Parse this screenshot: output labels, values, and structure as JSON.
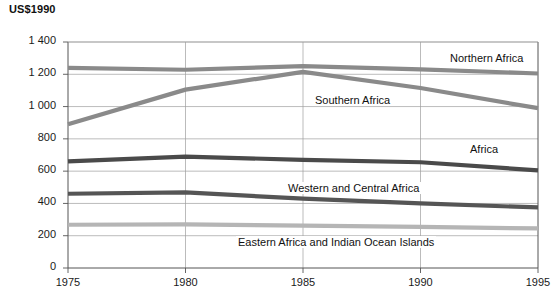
{
  "chart_data": {
    "type": "line",
    "title": "US$1990",
    "xlabel": "",
    "ylabel": "US$1990",
    "x": [
      1975,
      1980,
      1985,
      1990,
      1995
    ],
    "xlim": [
      1975,
      1995
    ],
    "ylim": [
      0,
      1400
    ],
    "yticks": [
      "0",
      "200",
      "400",
      "600",
      "800",
      "1 000",
      "1 200",
      "1 400"
    ],
    "xticks": [
      "1975",
      "1980",
      "1985",
      "1990",
      "1995"
    ],
    "grid": true,
    "legend": "inline-labels",
    "series": [
      {
        "name": "Northern Africa",
        "color": "#8a8a8a",
        "values": [
          1240,
          1228,
          1250,
          1230,
          1205
        ]
      },
      {
        "name": "Southern Africa",
        "color": "#8a8a8a",
        "values": [
          890,
          1105,
          1215,
          1115,
          990
        ]
      },
      {
        "name": "Africa",
        "color": "#4a4a4a",
        "values": [
          660,
          690,
          670,
          655,
          605
        ]
      },
      {
        "name": "Western and Central Africa",
        "color": "#555555",
        "values": [
          460,
          468,
          430,
          400,
          375
        ]
      },
      {
        "name": "Eastern Africa and Indian Ocean Islands",
        "color": "#b5b5b5",
        "values": [
          268,
          270,
          262,
          255,
          245
        ]
      }
    ],
    "annotations": [
      {
        "text": "Northern Africa",
        "x": 448,
        "y": 52
      },
      {
        "text": "Southern Africa",
        "x": 313,
        "y": 94
      },
      {
        "text": "Africa",
        "x": 468,
        "y": 143
      },
      {
        "text": "Western and Central Africa",
        "x": 286,
        "y": 182
      },
      {
        "text": "Eastern Africa and Indian Ocean Islands",
        "x": 236,
        "y": 236
      }
    ]
  }
}
